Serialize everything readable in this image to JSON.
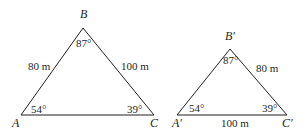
{
  "figure": {
    "triangle1": {
      "vertices": {
        "A": "A",
        "B": "B",
        "C": "C"
      },
      "sides": {
        "AB": "80 m",
        "BC": "100 m"
      },
      "angles": {
        "A": "54°",
        "B": "87°",
        "C": "39°"
      }
    },
    "triangle2": {
      "vertices": {
        "A": "A′",
        "B": "B′",
        "C": "C′"
      },
      "sides": {
        "BC": "80 m",
        "AC": "100 m"
      },
      "angles": {
        "A": "54°",
        "B": "87°",
        "C": "39°"
      }
    }
  }
}
